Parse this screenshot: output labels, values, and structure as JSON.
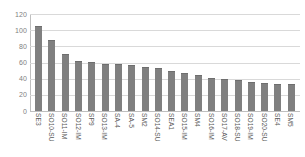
{
  "chart_data": {
    "type": "bar",
    "title": "",
    "subtitle": "",
    "xlabel": "",
    "ylabel": "",
    "ylim": [
      0,
      120
    ],
    "yticks": [
      0,
      20,
      40,
      60,
      80,
      100,
      120
    ],
    "ytick_labels": [
      "0",
      "20",
      "40",
      "60",
      "80",
      "100",
      "120"
    ],
    "grid": true,
    "legend": false,
    "legend_position": "none",
    "bar_color": "#808080",
    "gridline_color": "#d9d9d9",
    "axis_color": "#bfbfbf",
    "categories": [
      "SE3",
      "SO10-SU",
      "SO11-IM",
      "SO12-IM",
      "SP9",
      "SO13-IM",
      "SA-4",
      "SA-5",
      "SM2",
      "SO14-SU",
      "SEA1",
      "SO15-IM",
      "SM4",
      "SO16-IM",
      "SO17-AV",
      "SO18-SU",
      "SO19-IM",
      "SO20-SU",
      "SE4",
      "SM5"
    ],
    "values": [
      105,
      88,
      70,
      62,
      61,
      58,
      58,
      57,
      55,
      53,
      49,
      47,
      44,
      41,
      39,
      38,
      36,
      35,
      33,
      33
    ]
  }
}
